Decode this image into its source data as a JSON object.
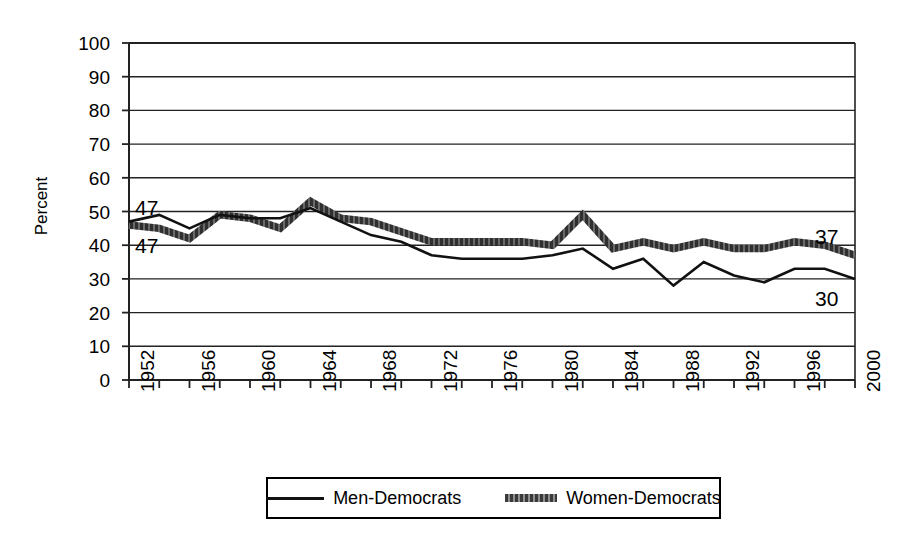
{
  "chart_data": {
    "type": "line",
    "title": "",
    "xlabel": "",
    "ylabel": "Percent",
    "ylim": [
      0,
      100
    ],
    "ytick_step": 10,
    "yticks": [
      100,
      90,
      80,
      70,
      60,
      50,
      40,
      30,
      20,
      10,
      0
    ],
    "xlim": [
      1952,
      2000
    ],
    "xtick_step_minor": 2,
    "xtick_labels": [
      "1952",
      "1956",
      "1960",
      "1964",
      "1968",
      "1972",
      "1976",
      "1980",
      "1984",
      "1988",
      "1992",
      "1996",
      "2000"
    ],
    "x": [
      1952,
      1954,
      1956,
      1958,
      1960,
      1962,
      1964,
      1966,
      1968,
      1970,
      1972,
      1974,
      1976,
      1978,
      1980,
      1982,
      1984,
      1986,
      1988,
      1990,
      1992,
      1994,
      1996,
      1998,
      2000
    ],
    "grid": "horizontal",
    "legend_position": "bottom",
    "series": [
      {
        "name": "Men-Democrats",
        "style": "thin-solid-black",
        "color": "#111111",
        "values": [
          47,
          49,
          45,
          49,
          48,
          48,
          51,
          47,
          43,
          41,
          37,
          36,
          36,
          36,
          37,
          39,
          33,
          36,
          28,
          35,
          31,
          29,
          33,
          33,
          30
        ]
      },
      {
        "name": "Women-Democrats",
        "style": "thick-textured-gray",
        "color": "#5a5a5a",
        "values": [
          46,
          45,
          42,
          49,
          48,
          45,
          53,
          48,
          47,
          44,
          41,
          41,
          41,
          41,
          40,
          49,
          39,
          41,
          39,
          41,
          39,
          39,
          41,
          40,
          37
        ]
      }
    ],
    "annotations": [
      {
        "text": "47",
        "series": "Men-Democrats",
        "position": "start-upper",
        "x": 1952,
        "y": 47
      },
      {
        "text": "47",
        "series": "Women-Democrats",
        "position": "start-lower",
        "x": 1952,
        "y": 47
      },
      {
        "text": "37",
        "series": "Women-Democrats",
        "position": "end-upper",
        "x": 2000,
        "y": 37
      },
      {
        "text": "30",
        "series": "Men-Democrats",
        "position": "end-lower",
        "x": 2000,
        "y": 30
      }
    ]
  },
  "legend": {
    "items": [
      {
        "label": "Men-Democrats",
        "swatch": "thin-line-swatch"
      },
      {
        "label": "Women-Democrats",
        "swatch": "thick-dashed-swatch"
      }
    ]
  }
}
